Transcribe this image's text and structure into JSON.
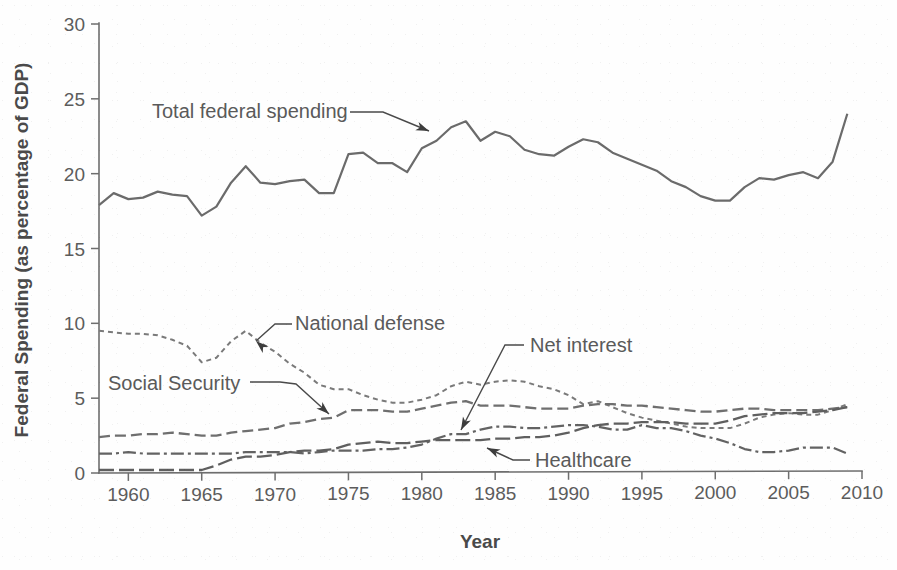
{
  "chart_data": {
    "type": "line",
    "title": "",
    "xlabel": "Year",
    "ylabel": "Federal Spending (as percentage of GDP)",
    "xlim": [
      1958,
      2010
    ],
    "ylim": [
      0,
      30
    ],
    "xticks": [
      1960,
      1965,
      1970,
      1975,
      1980,
      1985,
      1990,
      1995,
      2000,
      2005,
      2010
    ],
    "xtick_labels": [
      "1960",
      "1965",
      "1970",
      "1975",
      "1980",
      "1985",
      "1990",
      "1995",
      "2000",
      "2005",
      "2010"
    ],
    "yticks": [
      0,
      5,
      10,
      15,
      20,
      25,
      30
    ],
    "ytick_labels": [
      "0",
      "5",
      "10",
      "15",
      "20",
      "25",
      "30"
    ],
    "grid": false,
    "legend": "annotations-inline",
    "x": [
      1958,
      1959,
      1960,
      1961,
      1962,
      1963,
      1964,
      1965,
      1966,
      1967,
      1968,
      1969,
      1970,
      1971,
      1972,
      1973,
      1974,
      1975,
      1976,
      1977,
      1978,
      1979,
      1980,
      1981,
      1982,
      1983,
      1984,
      1985,
      1986,
      1987,
      1988,
      1989,
      1990,
      1991,
      1992,
      1993,
      1994,
      1995,
      1996,
      1997,
      1998,
      1999,
      2000,
      2001,
      2002,
      2003,
      2004,
      2005,
      2006,
      2007,
      2008,
      2009
    ],
    "series": [
      {
        "name": "Total federal spending",
        "style": "solid",
        "color": "#6b6b6b",
        "width": 2.2,
        "values": [
          17.9,
          18.7,
          18.3,
          18.4,
          18.8,
          18.6,
          18.5,
          17.2,
          17.8,
          19.4,
          20.5,
          19.4,
          19.3,
          19.5,
          19.6,
          18.7,
          18.7,
          21.3,
          21.4,
          20.7,
          20.7,
          20.1,
          21.7,
          22.2,
          23.1,
          23.5,
          22.2,
          22.8,
          22.5,
          21.6,
          21.3,
          21.2,
          21.8,
          22.3,
          22.1,
          21.4,
          21.0,
          20.6,
          20.2,
          19.5,
          19.1,
          18.5,
          18.2,
          18.2,
          19.1,
          19.7,
          19.6,
          19.9,
          20.1,
          19.7,
          20.8,
          24.0
        ]
      },
      {
        "name": "National defense",
        "style": "dotted",
        "color": "#7a7a7a",
        "width": 2.0,
        "values": [
          9.5,
          9.4,
          9.3,
          9.3,
          9.2,
          8.9,
          8.5,
          7.4,
          7.7,
          8.8,
          9.5,
          8.7,
          8.1,
          7.3,
          6.7,
          5.9,
          5.6,
          5.6,
          5.2,
          4.9,
          4.7,
          4.7,
          4.9,
          5.2,
          5.8,
          6.1,
          5.9,
          6.1,
          6.2,
          6.1,
          5.8,
          5.6,
          5.2,
          4.6,
          4.8,
          4.4,
          4.0,
          3.7,
          3.5,
          3.3,
          3.1,
          3.0,
          3.0,
          3.0,
          3.3,
          3.7,
          3.9,
          4.0,
          3.9,
          3.9,
          4.2,
          4.6
        ]
      },
      {
        "name": "Social Security",
        "style": "dashed",
        "color": "#6f6f6f",
        "width": 2.3,
        "values": [
          2.4,
          2.5,
          2.5,
          2.6,
          2.6,
          2.7,
          2.6,
          2.5,
          2.5,
          2.7,
          2.8,
          2.9,
          3.0,
          3.3,
          3.4,
          3.6,
          3.7,
          4.2,
          4.2,
          4.2,
          4.1,
          4.1,
          4.3,
          4.5,
          4.7,
          4.8,
          4.5,
          4.5,
          4.5,
          4.4,
          4.3,
          4.3,
          4.3,
          4.5,
          4.6,
          4.6,
          4.5,
          4.5,
          4.4,
          4.3,
          4.2,
          4.1,
          4.1,
          4.2,
          4.3,
          4.3,
          4.2,
          4.2,
          4.2,
          4.2,
          4.3,
          4.4
        ]
      },
      {
        "name": "Net interest",
        "style": "dashdot",
        "color": "#636363",
        "width": 2.2,
        "values": [
          1.3,
          1.3,
          1.4,
          1.3,
          1.3,
          1.3,
          1.3,
          1.3,
          1.3,
          1.3,
          1.4,
          1.4,
          1.4,
          1.4,
          1.3,
          1.4,
          1.5,
          1.5,
          1.5,
          1.6,
          1.6,
          1.7,
          1.9,
          2.3,
          2.6,
          2.6,
          2.9,
          3.1,
          3.1,
          3.0,
          3.0,
          3.1,
          3.2,
          3.2,
          3.1,
          2.9,
          2.9,
          3.2,
          3.0,
          3.0,
          2.8,
          2.5,
          2.3,
          2.0,
          1.6,
          1.4,
          1.4,
          1.5,
          1.7,
          1.7,
          1.7,
          1.3
        ]
      },
      {
        "name": "Healthcare",
        "style": "longdash",
        "color": "#5f5f5f",
        "width": 2.3,
        "values": [
          0.2,
          0.2,
          0.2,
          0.2,
          0.2,
          0.2,
          0.2,
          0.2,
          0.5,
          0.9,
          1.1,
          1.1,
          1.2,
          1.4,
          1.5,
          1.5,
          1.6,
          1.9,
          2.0,
          2.1,
          2.0,
          2.0,
          2.1,
          2.2,
          2.2,
          2.2,
          2.2,
          2.3,
          2.3,
          2.4,
          2.4,
          2.5,
          2.7,
          3.0,
          3.2,
          3.3,
          3.3,
          3.4,
          3.4,
          3.4,
          3.3,
          3.3,
          3.3,
          3.5,
          3.8,
          3.9,
          4.0,
          4.0,
          4.0,
          4.1,
          4.2,
          4.4
        ]
      }
    ],
    "annotations": [
      {
        "id": "total-federal-spending",
        "text": "Total federal spending",
        "label_x": 152,
        "label_y": 118,
        "leader": "M 350,112 L 383,112 L 429,131",
        "head_x": 429,
        "head_y": 131,
        "head_angle": 22
      },
      {
        "id": "national-defense",
        "text": "National defense",
        "label_x": 295,
        "label_y": 330,
        "leader": "M 292,324 L 275,324 L 256,341",
        "head_x": 256,
        "head_y": 341,
        "head_angle": 222
      },
      {
        "id": "social-security",
        "text": "Social Security",
        "label_x": 108,
        "label_y": 390,
        "leader": "M 250,382 L 280,382 L 296,384 L 329,414",
        "head_x": 329,
        "head_y": 414,
        "head_angle": 42
      },
      {
        "id": "net-interest",
        "text": "Net interest",
        "label_x": 530,
        "label_y": 352,
        "leader": "M 524,345 L 505,345 L 461,430",
        "head_x": 461,
        "head_y": 430,
        "head_angle": 117
      },
      {
        "id": "healthcare",
        "text": "Healthcare",
        "label_x": 535,
        "label_y": 467,
        "leader": "M 530,460 L 513,460 L 487,448",
        "head_x": 487,
        "head_y": 448,
        "head_angle": 205
      }
    ]
  },
  "figure": {
    "plot_left": 99,
    "plot_right": 862,
    "plot_top": 24,
    "plot_bottom": 473,
    "axis_color": "#6e6e6e",
    "background": "#fefefe",
    "text_color": "#5a5a5a",
    "tick_length": 8
  }
}
